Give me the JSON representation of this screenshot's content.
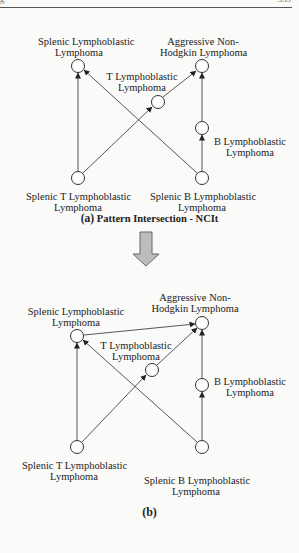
{
  "header": {
    "left": "g",
    "right": "335"
  },
  "diagram_a": {
    "nodes": {
      "top_left": {
        "line1": "Splenic Lymphoblastic",
        "line2": "Lymphoma"
      },
      "top_right": {
        "line1": "Aggressive Non-",
        "line2": "Hodgkin Lymphoma"
      },
      "t_mid": {
        "line1": "T Lymphoblastic",
        "line2": "Lymphoma"
      },
      "b_mid": {
        "line1": "B Lymphoblastic",
        "line2": "Lymphoma"
      },
      "bottom_left": {
        "line1": "Splenic T Lymphoblastic",
        "line2": "Lymphoma"
      },
      "bottom_right": {
        "line1": "Splenic B Lymphoblastic",
        "line2": "Lymphoma"
      }
    },
    "caption_tag": "(a)",
    "caption_text": "Pattern Intersection - NCIt"
  },
  "arrow": {
    "icon": "down-arrow-icon",
    "fill": "#bdbdbd",
    "stroke": "#666666"
  },
  "diagram_b": {
    "nodes": {
      "top_left": {
        "line1": "Splenic Lymphoblastic",
        "line2": "Lymphoma"
      },
      "top_right": {
        "line1": "Aggressive Non-",
        "line2": "Hodgkin Lymphoma"
      },
      "t_mid": {
        "line1": "T Lymphoblastic",
        "line2": "Lymphoma"
      },
      "b_mid": {
        "line1": "B Lymphoblastic",
        "line2": "Lymphoma"
      },
      "bottom_left": {
        "line1": "Splenic T Lymphoblastic",
        "line2": "Lymphoma"
      },
      "bottom_right": {
        "line1": "Splenic B Lymphoblastic",
        "line2": "Lymphoma"
      }
    },
    "caption": "(b)"
  },
  "edges_a": [
    [
      "Splenic T Lymphoblastic Lymphoma",
      "Splenic Lymphoblastic Lymphoma"
    ],
    [
      "Splenic T Lymphoblastic Lymphoma",
      "T Lymphoblastic Lymphoma"
    ],
    [
      "T Lymphoblastic Lymphoma",
      "Aggressive Non-Hodgkin Lymphoma"
    ],
    [
      "Splenic B Lymphoblastic Lymphoma",
      "Splenic Lymphoblastic Lymphoma"
    ],
    [
      "Splenic B Lymphoblastic Lymphoma",
      "B Lymphoblastic Lymphoma"
    ],
    [
      "B Lymphoblastic Lymphoma",
      "Aggressive Non-Hodgkin Lymphoma"
    ]
  ],
  "edges_b_extra": [
    [
      "Splenic Lymphoblastic Lymphoma",
      "Aggressive Non-Hodgkin Lymphoma"
    ]
  ]
}
